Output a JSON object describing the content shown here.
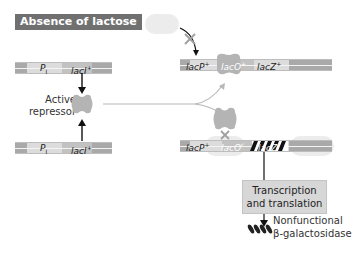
{
  "panel": {
    "condition_label": "Absence of lactose"
  },
  "left": {
    "top_gene": {
      "promoter": "P",
      "promoter_sub": "I",
      "gene": "lacI",
      "gene_sup": "+"
    },
    "bottom_gene": {
      "promoter": "P",
      "promoter_sub": "I",
      "gene": "lacI",
      "gene_sup": "+"
    },
    "repressor_label_line1": "Active",
    "repressor_label_line2": "repressor"
  },
  "right": {
    "top_operon": {
      "promoter": "lacP",
      "promoter_sup": "+",
      "operator": "lacO",
      "operator_sup": "+",
      "gene": "lacZ",
      "gene_sup": "+"
    },
    "bottom_operon": {
      "promoter": "lacP",
      "promoter_sup": "+",
      "operator": "lacO",
      "operator_sup": "c",
      "gene": "lacZ",
      "gene_sup": "-"
    },
    "process_box_line1": "Transcription",
    "process_box_line2": "and translation",
    "product_line1": "Nonfunctional",
    "product_line2": "β-galactosidase"
  },
  "colors": {
    "badge_bg": "#707070",
    "repressor": "#b4b4b4",
    "dna_dark": "#a9a9a9",
    "dna_light": "#d3d3d3",
    "arrow": "#111111",
    "blocked_x": "#a0a0a0",
    "process_box": "#d7d7d7"
  }
}
